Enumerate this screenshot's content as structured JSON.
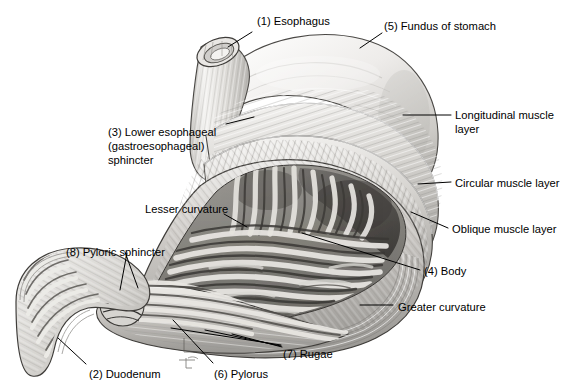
{
  "figure": {
    "background_color": "#ffffff",
    "width": 581,
    "height": 389
  },
  "labels": [
    {
      "id": "esophagus",
      "text": "(1) Esophagus",
      "x": 257,
      "y": 15
    },
    {
      "id": "fundus",
      "text": "(5) Fundus of stomach",
      "x": 384,
      "y": 20
    },
    {
      "id": "lower-esophageal-1",
      "text": "(3) Lower esophageal",
      "x": 108,
      "y": 126
    },
    {
      "id": "lower-esophageal-2",
      "text": "(gastroesophageal)",
      "x": 108,
      "y": 140
    },
    {
      "id": "lower-esophageal-3",
      "text": "sphincter",
      "x": 108,
      "y": 154
    },
    {
      "id": "longitudinal-1",
      "text": "Longitudinal muscle",
      "x": 455,
      "y": 109
    },
    {
      "id": "longitudinal-2",
      "text": "layer",
      "x": 455,
      "y": 123
    },
    {
      "id": "circular",
      "text": "Circular muscle layer",
      "x": 455,
      "y": 177
    },
    {
      "id": "oblique",
      "text": "Oblique muscle layer",
      "x": 452,
      "y": 223
    },
    {
      "id": "lesser-curvature",
      "text": "Lesser curvature",
      "x": 145,
      "y": 203
    },
    {
      "id": "pyloric-sphincter",
      "text": "(8) Pyloric sphincter",
      "x": 66,
      "y": 246
    },
    {
      "id": "body",
      "text": "(4) Body",
      "x": 424,
      "y": 265
    },
    {
      "id": "greater-curvature",
      "text": "Greater curvature",
      "x": 398,
      "y": 301
    },
    {
      "id": "rugae",
      "text": "(7) Rugae",
      "x": 283,
      "y": 348
    },
    {
      "id": "duodenum",
      "text": "(2) Duodenum",
      "x": 89,
      "y": 368
    },
    {
      "id": "pylorus",
      "text": "(6) Pylorus",
      "x": 214,
      "y": 368
    }
  ],
  "leaders": [
    {
      "id": "leader-esophagus",
      "points": "252,32 228,47"
    },
    {
      "id": "leader-fundus",
      "points": "382,33 360,48"
    },
    {
      "id": "leader-lower-esophageal",
      "points": "226,124 254,117"
    },
    {
      "id": "leader-longitudinal",
      "points": "451,115 403,115"
    },
    {
      "id": "leader-circular",
      "points": "451,182 418,184"
    },
    {
      "id": "leader-oblique",
      "points": "448,228 411,212"
    },
    {
      "id": "leader-lesser-curvature",
      "points": "224,214 247,227"
    },
    {
      "id": "leader-pyloric-a",
      "points": "125,252 138,288"
    },
    {
      "id": "leader-pyloric-b",
      "points": "127,253 120,290"
    },
    {
      "id": "leader-body",
      "points": "420,270 302,233"
    },
    {
      "id": "leader-greater-curvature",
      "points": "393,305 360,305"
    },
    {
      "id": "leader-rugae-a",
      "points": "281,345 171,328"
    },
    {
      "id": "leader-rugae-b",
      "points": "281,346 205,330"
    },
    {
      "id": "leader-rugae-c",
      "points": "282,347 232,334"
    },
    {
      "id": "leader-duodenum",
      "points": "86,364 58,338"
    },
    {
      "id": "leader-pylorus",
      "points": "213,363 173,320"
    }
  ],
  "structures": {
    "esophagus": "esophageal-tube",
    "fundus": "fundus-dome",
    "body": "stomach-body",
    "pylorus": "pyloric-canal",
    "duodenum": "duodenal-curve",
    "rugae": "mucosal-folds",
    "muscle_layers": [
      "longitudinal",
      "circular",
      "oblique"
    ]
  },
  "palette": {
    "outline": "#2b2b2b",
    "tissue_light": "#f2f1ef",
    "tissue_mid": "#c9c7c3",
    "tissue_dark": "#8d8b88",
    "lumen_shadow": "#4c4a48",
    "rugae_highlight": "#e8e6e2",
    "leader_line": "#000000"
  }
}
